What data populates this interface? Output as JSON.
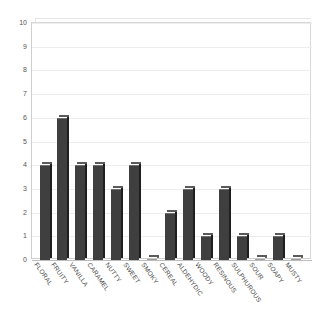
{
  "chart_data": {
    "type": "bar",
    "title": "",
    "subtitle": "",
    "xlabel": "",
    "ylabel": "",
    "ylim": [
      0,
      10
    ],
    "grid": true,
    "legend": "none",
    "y_ticks": [
      0,
      1,
      2,
      3,
      4,
      5,
      6,
      7,
      8,
      9,
      10
    ],
    "categories": [
      "FLORAL",
      "FRUITY",
      "VANILLA",
      "CARAMEL",
      "NUTTY",
      "SWEET",
      "SMOKY",
      "CEREAL",
      "ALDEHYDIC",
      "WOODY",
      "RESINOUS",
      "SULPHUROUS",
      "SOUR",
      "SOAPY",
      "MUSTY"
    ],
    "values": [
      4,
      6,
      4,
      4,
      3,
      4,
      0,
      2,
      3,
      1,
      3,
      1,
      0,
      1,
      0
    ],
    "colors": {
      "bar_face": "#3f3f3f",
      "bar_side": "#1f1f1f",
      "bar_top": "#5a5a5a",
      "gridline": "#ededed",
      "axis": "#bdbdbd",
      "tick_text": "#555555",
      "label_text": "#4a4a4a",
      "background": "#ffffff"
    }
  }
}
